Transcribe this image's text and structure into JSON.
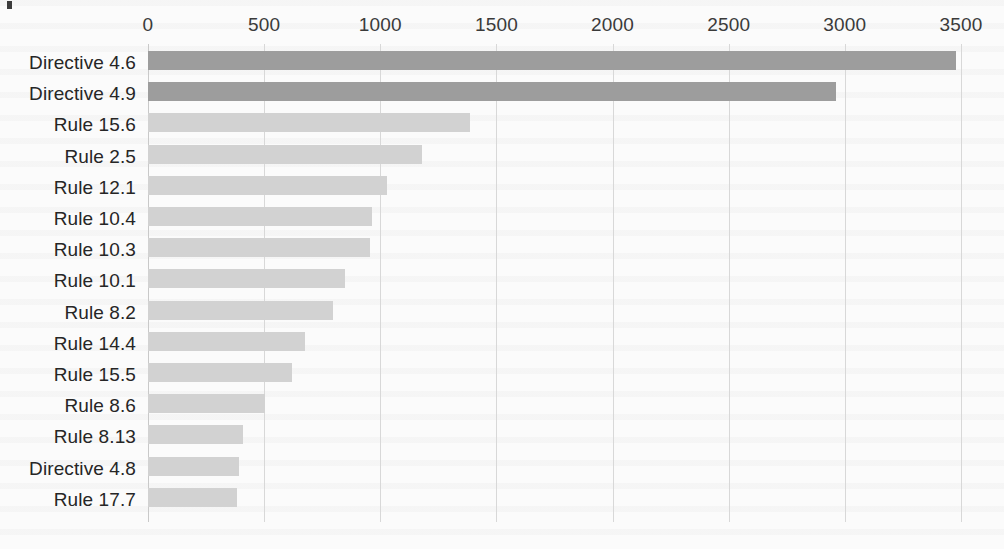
{
  "page": {
    "background_color": "#fbfbfb",
    "corner_mark": "partial-cropped-glyph"
  },
  "chart_data": {
    "type": "bar",
    "orientation": "horizontal",
    "title": "",
    "subtitle": "",
    "xlabel": "",
    "ylabel": "",
    "xlim": [
      0,
      3500
    ],
    "ylim": null,
    "grid": true,
    "grid_axis": "x",
    "legend": false,
    "legend_position": "none",
    "x_tick_labels": [
      "0",
      "500",
      "1000",
      "1500",
      "2000",
      "2500",
      "3000",
      "3500"
    ],
    "x_ticks": [
      0,
      500,
      1000,
      1500,
      2000,
      2500,
      3000,
      3500
    ],
    "x_axis_position": "top",
    "categories": [
      "Directive 4.6",
      "Directive 4.9",
      "Rule 15.6",
      "Rule 2.5",
      "Rule 12.1",
      "Rule 10.4",
      "Rule 10.3",
      "Rule 10.1",
      "Rule 8.2",
      "Rule 14.4",
      "Rule 15.5",
      "Rule 8.6",
      "Rule 8.13",
      "Directive 4.8",
      "Rule 17.7"
    ],
    "values": [
      3480,
      2960,
      1385,
      1180,
      1030,
      965,
      955,
      850,
      795,
      675,
      620,
      505,
      410,
      390,
      385
    ],
    "bar_colors": [
      "#9d9d9d",
      "#9d9d9d",
      "#d2d2d2",
      "#d2d2d2",
      "#d2d2d2",
      "#d2d2d2",
      "#d2d2d2",
      "#d2d2d2",
      "#d2d2d2",
      "#d2d2d2",
      "#d2d2d2",
      "#d2d2d2",
      "#d2d2d2",
      "#d2d2d2",
      "#d2d2d2"
    ],
    "colors": {
      "highlight_bar": "#9d9d9d",
      "normal_bar": "#d2d2d2",
      "gridline": "#d8d8d8",
      "tick_text": "#3a3a3a",
      "category_text": "#262626"
    }
  }
}
